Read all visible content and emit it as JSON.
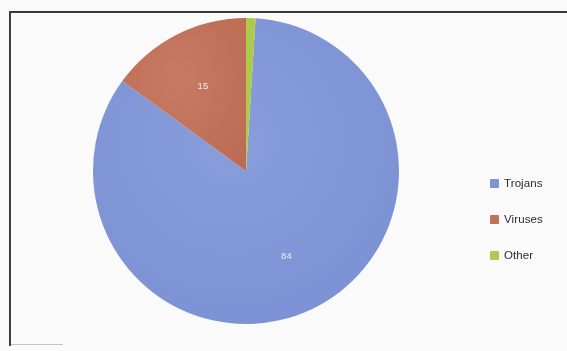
{
  "chart_data": {
    "type": "pie",
    "title": "",
    "categories": [
      "Trojans",
      "Viruses",
      "Other"
    ],
    "values": [
      84,
      15,
      1
    ],
    "value_labels": [
      "84",
      "15",
      ""
    ],
    "colors": [
      "#8096d8",
      "#c4715a",
      "#b0cd4c"
    ],
    "legend_position": "right",
    "grid": false,
    "start_angle_deg": 0,
    "direction": "clockwise",
    "slice_label_color": "#f2f2f2",
    "units": "percent"
  },
  "legend": {
    "items": [
      {
        "label": "Trojans",
        "color": "#8096d8",
        "swatch_name": "legend-swatch-trojans"
      },
      {
        "label": "Viruses",
        "color": "#c4715a",
        "swatch_name": "legend-swatch-viruses"
      },
      {
        "label": "Other",
        "color": "#b0cd4c",
        "swatch_name": "legend-swatch-other"
      }
    ]
  },
  "pie": {
    "slices": [
      {
        "name": "Trojans",
        "value": 84,
        "label": "84",
        "color": "#8096d8"
      },
      {
        "name": "Viruses",
        "value": 15,
        "label": "15",
        "color": "#c4715a"
      },
      {
        "name": "Other",
        "value": 1,
        "label": "",
        "color": "#b0cd4c"
      }
    ]
  },
  "frame": {
    "border_color": "#1f1f1f",
    "background": "#ffffff"
  }
}
